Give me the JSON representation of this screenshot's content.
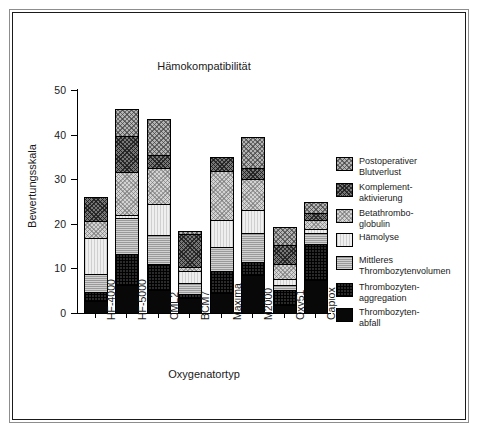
{
  "chart_data": {
    "type": "bar",
    "subtype": "stacked-vertical",
    "title": "Hämokompatibilität",
    "xlabel": "Oxygenatortyp",
    "ylabel": "Bewertungsskala",
    "ylim": [
      0,
      50
    ],
    "yticks": [
      0,
      10,
      20,
      30,
      40,
      50
    ],
    "ytick_labels": [
      "0",
      "10",
      "20",
      "30",
      "40",
      "50"
    ],
    "grid": false,
    "legend_position": "right",
    "categories": [
      "HF-4000",
      "HF-5000",
      "CML2",
      "BCM7",
      "Maxima",
      "M2000",
      "Oxy51",
      "Capiox"
    ],
    "series": [
      {
        "name": "Thrombozytenabfall",
        "legend_label": "Thrombozyten-\nabfall",
        "fill": "solid-black",
        "color": "#080808",
        "values": [
          2.5,
          6.0,
          5.0,
          3.2,
          4.2,
          8.2,
          1.5,
          7.2
        ]
      },
      {
        "name": "Thrombozytenaggregation",
        "legend_label": "Thrombozyten-\naggregation",
        "fill": "dark-crosshatch",
        "color": "#2a2a2a",
        "values": [
          2.0,
          7.0,
          5.8,
          0.9,
          5.0,
          3.0,
          3.5,
          8.0
        ]
      },
      {
        "name": "Mittleres Thrombozytenvolumen",
        "legend_label": "Mittleres\nThrombozytenvolumen",
        "fill": "grey-hlines",
        "color": "#9a9a9a",
        "values": [
          4.0,
          8.0,
          6.5,
          2.3,
          5.3,
          6.5,
          1.0,
          2.5
        ]
      },
      {
        "name": "Hämolyse",
        "legend_label": "Hämolyse",
        "fill": "very-light-vlines",
        "color": "#efefef",
        "values": [
          8.0,
          0.7,
          7.0,
          2.8,
          6.2,
          5.2,
          1.3,
          1.0
        ]
      },
      {
        "name": "Betathromboglobulin",
        "legend_label": "Betathrombo-\nglobulin",
        "fill": "light-checker",
        "color": "#d3d3d3",
        "values": [
          4.0,
          9.8,
          8.0,
          1.0,
          11.0,
          7.0,
          3.5,
          2.0
        ]
      },
      {
        "name": "Komplementaktivierung",
        "legend_label": "Komplement-\naktivierung",
        "fill": "dark-checker",
        "color": "#777777",
        "values": [
          5.3,
          8.0,
          2.8,
          7.3,
          3.0,
          2.5,
          4.2,
          1.5
        ]
      },
      {
        "name": "Postoperativer Blutverlust",
        "legend_label": "Postoperativer\nBlutverlust",
        "fill": "mid-checker",
        "color": "#b4b4b4",
        "values": [
          0.0,
          6.0,
          8.2,
          0.7,
          0.0,
          6.8,
          4.0,
          2.5
        ]
      }
    ],
    "totals": [
      25.8,
      45.5,
      43.3,
      18.2,
      34.7,
      39.2,
      19.0,
      24.7
    ]
  }
}
